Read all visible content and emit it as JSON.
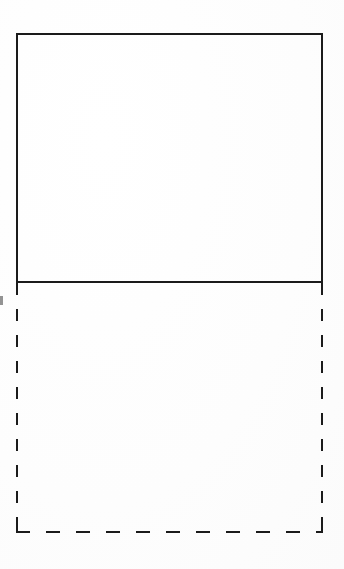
{
  "figure": {
    "background_color": "#ffffff",
    "stroke_color": "#1b1b1b",
    "stroke_width_px": 2,
    "canvas": {
      "width_px": 344,
      "height_px": 569
    },
    "shapes": [
      {
        "name": "upper-rectangle",
        "stroke_style": "solid",
        "fill": "none",
        "x_px": 16,
        "y_px": 33,
        "width_px": 307,
        "height_px": 250
      },
      {
        "name": "lower-rectangle",
        "stroke_style": "dashed",
        "fill": "none",
        "x_px": 16,
        "y_px": 283,
        "width_px": 307,
        "height_px": 250,
        "dash_horizontal": {
          "dash_px": 14,
          "gap_px": 16
        },
        "dash_vertical": {
          "dash_px": 12,
          "gap_px": 14
        }
      }
    ],
    "artifacts": [
      {
        "name": "left-margin-fragment",
        "x_px": 0,
        "y_px": 296,
        "width_px": 3,
        "height_px": 9
      }
    ]
  }
}
